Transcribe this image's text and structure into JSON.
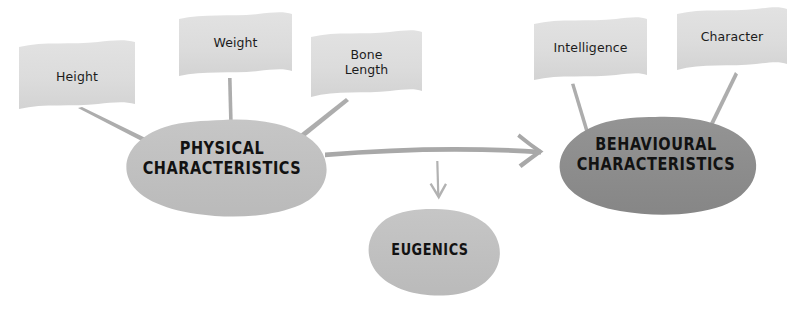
{
  "diagram": {
    "type": "concept-map",
    "background_color": "#ffffff",
    "canvas": {
      "width": 800,
      "height": 318
    },
    "palette": {
      "flag_fill": "#dcdcdc",
      "flag_fill_shade": "#d2d2d2",
      "node_light_fill": "#bfbfbf",
      "node_dark_fill": "#8c8c8c",
      "connector_stroke": "#adadad",
      "arrow_stroke": "#a8a8a8",
      "text_dark": "#121212",
      "text_label": "#1c1c1c"
    },
    "nodes": [
      {
        "id": "physical",
        "label": "PHYSICAL\nCHARACTERISTICS",
        "shape": "blob",
        "fill": "#bfbfbf",
        "center": {
          "x": 222,
          "y": 164
        }
      },
      {
        "id": "behavioural",
        "label": "BEHAVIOURAL\nCHARACTERISTICS",
        "shape": "blob",
        "fill": "#8c8c8c",
        "center": {
          "x": 656,
          "y": 160
        }
      },
      {
        "id": "eugenics",
        "label": "EUGENICS",
        "shape": "blob",
        "fill": "#bfbfbf",
        "center": {
          "x": 430,
          "y": 251
        }
      }
    ],
    "flags": [
      {
        "id": "height",
        "label": "Height",
        "fill": "#dcdcdc",
        "connects_to": "physical"
      },
      {
        "id": "weight",
        "label": "Weight",
        "fill": "#dcdcdc",
        "connects_to": "physical"
      },
      {
        "id": "bone-length",
        "label": "Bone\nLength",
        "fill": "#dcdcdc",
        "connects_to": "physical"
      },
      {
        "id": "intelligence",
        "label": "Intelligence",
        "fill": "#dcdcdc",
        "connects_to": "behavioural"
      },
      {
        "id": "character",
        "label": "Character",
        "fill": "#dcdcdc",
        "connects_to": "behavioural"
      }
    ],
    "arrows": [
      {
        "id": "physical-to-behavioural",
        "from": "physical",
        "to": "behavioural",
        "direction": "right",
        "style": "hand-drawn-thick",
        "stroke": "#a8a8a8"
      },
      {
        "id": "physical-to-eugenics",
        "from": "physical",
        "to": "eugenics",
        "direction": "down",
        "style": "hand-drawn-thin",
        "stroke": "#b2b2b2"
      }
    ]
  }
}
